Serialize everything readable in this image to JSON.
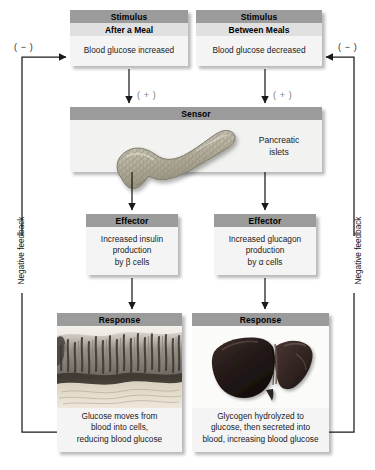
{
  "diagram": {
    "background_color": "#ffffff",
    "header_color": "#9b9b9b",
    "subheader_color": "#e0e0e0",
    "body_color": "#f4f4f4"
  },
  "left_loop": {
    "stimulus": {
      "header": "Stimulus",
      "subheader": "After a Meal",
      "body": "Blood glucose increased"
    },
    "sign_to_sensor": "( + )",
    "effector": {
      "header": "Effector",
      "body": "Increased insulin\nproduction\nby β cells"
    },
    "effector_lines": [
      "Increased insulin",
      "production",
      "by β cells"
    ],
    "response": {
      "header": "Response",
      "caption_lines": [
        "Glucose moves from",
        "blood into cells,",
        "reducing blood glucose"
      ],
      "image_name": "intestinal-villi-micrograph"
    },
    "feedback_label": "Negative feedback",
    "feedback_sign": "( − )"
  },
  "right_loop": {
    "stimulus": {
      "header": "Stimulus",
      "subheader": "Between Meals",
      "body": "Blood glucose decreased"
    },
    "sign_to_sensor": "( + )",
    "effector": {
      "header": "Effector",
      "body": "Increased glucagon\nproduction\nby α cells"
    },
    "effector_lines": [
      "Increased glucagon",
      "production",
      "by α cells"
    ],
    "response": {
      "header": "Response",
      "caption_lines": [
        "Glycogen hydrolyzed to",
        "glucose, then secreted into",
        "blood, increasing blood glucose"
      ],
      "image_name": "liver-illustration"
    },
    "feedback_label": "Negative feedback",
    "feedback_sign": "( − )"
  },
  "sensor": {
    "header": "Sensor",
    "organ_label_lines": [
      "Pancreatic",
      "islets"
    ],
    "image_name": "pancreas-illustration"
  }
}
